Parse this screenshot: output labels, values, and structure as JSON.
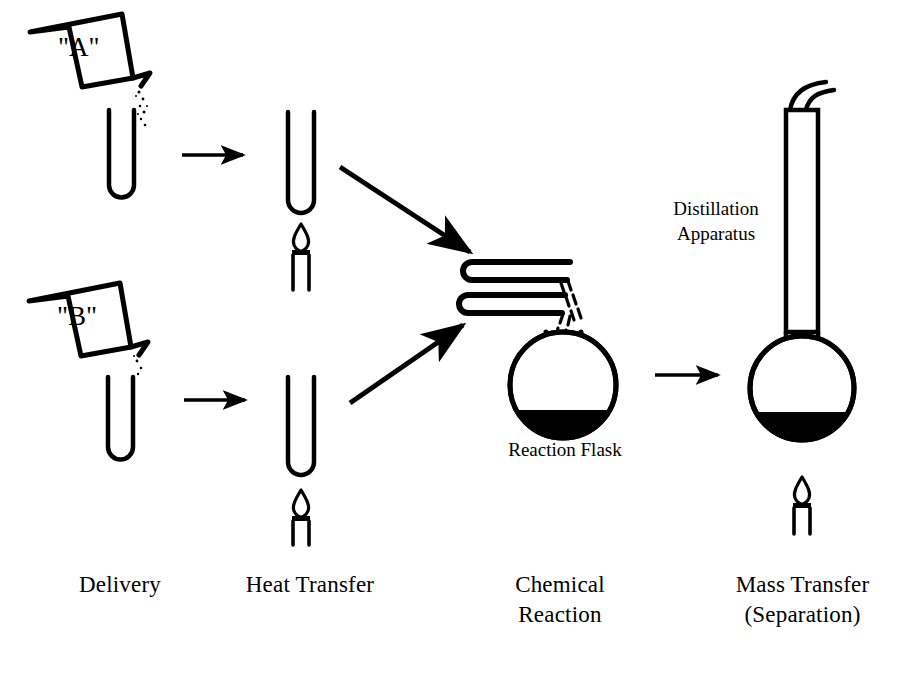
{
  "diagram": {
    "ink_color": "#000000",
    "background_color": "#ffffff",
    "stages": [
      {
        "id": "delivery",
        "label": "Delivery"
      },
      {
        "id": "heat-transfer",
        "label": "Heat Transfer"
      },
      {
        "id": "chemical-reaction",
        "label": "Chemical\nReaction"
      },
      {
        "id": "mass-transfer",
        "label": "Mass Transfer\n(Separation)"
      }
    ],
    "vessels": [
      {
        "id": "beaker-a",
        "letter": "\"A\""
      },
      {
        "id": "beaker-b",
        "letter": "\"B\""
      }
    ],
    "annotations": [
      {
        "id": "reaction-flask",
        "text": "Reaction Flask"
      },
      {
        "id": "distillation-apparatus",
        "text": "Distillation\nApparatus"
      }
    ],
    "equipment": [
      {
        "id": "test-tube-a",
        "name": "test-tube"
      },
      {
        "id": "test-tube-b",
        "name": "test-tube"
      },
      {
        "id": "burner-a",
        "name": "bunsen-burner"
      },
      {
        "id": "burner-b",
        "name": "bunsen-burner"
      },
      {
        "id": "condenser-tubes",
        "name": "condenser-tubes"
      },
      {
        "id": "round-flask",
        "name": "round-bottom-flask"
      },
      {
        "id": "distill-column",
        "name": "distillation-column"
      },
      {
        "id": "distill-flask",
        "name": "round-bottom-flask"
      },
      {
        "id": "burner-c",
        "name": "bunsen-burner"
      }
    ],
    "arrows": [
      {
        "id": "arrow-a-to-heat",
        "direction": "right"
      },
      {
        "id": "arrow-b-to-heat",
        "direction": "right"
      },
      {
        "id": "arrow-heat-a-to-react",
        "direction": "down-right"
      },
      {
        "id": "arrow-heat-b-to-react",
        "direction": "up-right"
      },
      {
        "id": "arrow-react-to-distill",
        "direction": "right"
      }
    ]
  }
}
